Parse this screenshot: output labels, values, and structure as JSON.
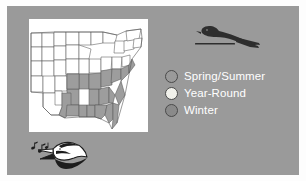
{
  "figure": {
    "background_color": "#9a9a9a",
    "border_color": "#fdfdfd",
    "map_background": "#ffffff"
  },
  "map": {
    "name": "united-states-range-map",
    "shaded_region_color": "#9d9d9d",
    "outline_color": "#585858",
    "unshaded_region_color": "#ffffff"
  },
  "bird_silhouette": {
    "name": "perched-bird-silhouette",
    "color": "#2e2e2e"
  },
  "singing_bird": {
    "name": "singing-bird-head",
    "body_color": "#ffffff",
    "accent_color": "#1d1d1d",
    "note_color": "#1d1d1d"
  },
  "legend": {
    "items": [
      {
        "label": "Spring/Summer",
        "swatch_color": "#9a9a9a",
        "icon": "circle-icon"
      },
      {
        "label": "Year-Round",
        "swatch_color": "#f0f0ea",
        "icon": "circle-icon"
      },
      {
        "label": "Winter",
        "swatch_color": "#8a8a8a",
        "icon": "circle-icon"
      }
    ],
    "text_color": "#ffffff"
  }
}
